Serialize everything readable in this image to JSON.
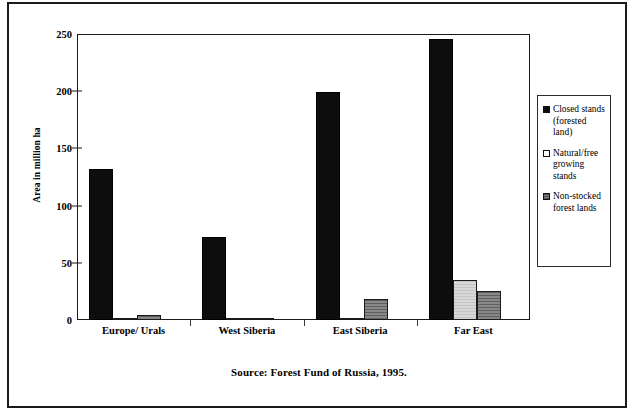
{
  "figure": {
    "source_caption": "Source: Forest Fund of Russia, 1995."
  },
  "chart_data": {
    "type": "bar",
    "title": "",
    "subtitle": "",
    "xlabel": "",
    "ylabel": "Area in million ha",
    "ylim": [
      0,
      250
    ],
    "yticks": [
      0,
      50,
      100,
      150,
      200,
      250
    ],
    "ytick_labels": [
      "0",
      "50",
      "100",
      "150",
      "200",
      "250"
    ],
    "grid": false,
    "legend_position": "right",
    "categories": [
      "Europe/ Urals",
      "West Siberia",
      "East Siberia",
      "Far East"
    ],
    "series": [
      {
        "name": "Closed stands (forested land)",
        "color": "#0d0d0d",
        "values": [
          132,
          73,
          199,
          246
        ]
      },
      {
        "name": "Natural/free growing stands",
        "color": "#ffffff",
        "values": [
          1.5,
          0.5,
          2,
          35
        ]
      },
      {
        "name": "Non-stocked forest lands",
        "color": "#7b7b7b",
        "values": [
          4,
          2,
          18,
          25
        ]
      }
    ]
  }
}
